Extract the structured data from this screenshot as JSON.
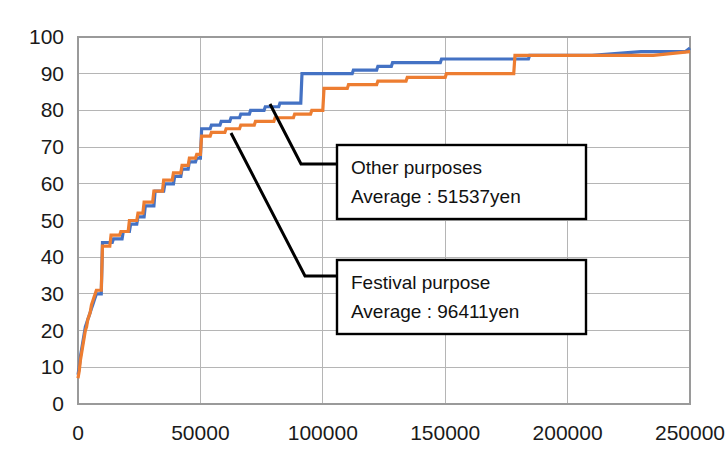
{
  "chart_data": {
    "type": "line",
    "title": "",
    "xlabel": "",
    "ylabel": "",
    "xlim": [
      0,
      250000
    ],
    "ylim": [
      0,
      100
    ],
    "grid": true,
    "legend_position": "annotation-boxes",
    "x_ticks": [
      0,
      50000,
      100000,
      150000,
      200000,
      250000
    ],
    "x_tick_labels": [
      "0",
      "50000",
      "100000",
      "150000",
      "200000",
      "250000"
    ],
    "y_ticks": [
      0,
      10,
      20,
      30,
      40,
      50,
      60,
      70,
      80,
      90,
      100
    ],
    "y_tick_labels": [
      "0",
      "10",
      "20",
      "30",
      "40",
      "50",
      "60",
      "70",
      "80",
      "90",
      "100"
    ],
    "series": [
      {
        "name": "Other purposes",
        "color": "#4472C4",
        "average_yen": 51537,
        "points": [
          [
            0,
            8
          ],
          [
            500,
            10
          ],
          [
            1000,
            13
          ],
          [
            1500,
            15
          ],
          [
            2000,
            17
          ],
          [
            2500,
            19
          ],
          [
            3000,
            21
          ],
          [
            3500,
            22
          ],
          [
            4000,
            23
          ],
          [
            4500,
            24
          ],
          [
            5000,
            25
          ],
          [
            5500,
            26
          ],
          [
            6000,
            27
          ],
          [
            6500,
            28
          ],
          [
            7000,
            29
          ],
          [
            7500,
            30
          ],
          [
            9500,
            30
          ],
          [
            10000,
            44
          ],
          [
            14000,
            44
          ],
          [
            14500,
            45
          ],
          [
            18000,
            45
          ],
          [
            18500,
            47
          ],
          [
            21000,
            47
          ],
          [
            21500,
            49
          ],
          [
            24000,
            49
          ],
          [
            24500,
            51
          ],
          [
            27000,
            51
          ],
          [
            27500,
            54
          ],
          [
            31000,
            54
          ],
          [
            31500,
            58
          ],
          [
            35000,
            58
          ],
          [
            35500,
            60
          ],
          [
            39000,
            60
          ],
          [
            39500,
            62
          ],
          [
            42000,
            62
          ],
          [
            42500,
            64
          ],
          [
            45000,
            64
          ],
          [
            45500,
            66
          ],
          [
            48000,
            66
          ],
          [
            48500,
            67
          ],
          [
            50000,
            67
          ],
          [
            50500,
            75
          ],
          [
            54000,
            75
          ],
          [
            54500,
            76
          ],
          [
            58000,
            76
          ],
          [
            58500,
            77
          ],
          [
            62000,
            77
          ],
          [
            62500,
            78
          ],
          [
            66000,
            78
          ],
          [
            66500,
            79
          ],
          [
            70000,
            79
          ],
          [
            70500,
            80
          ],
          [
            76000,
            80
          ],
          [
            76500,
            81
          ],
          [
            82000,
            81
          ],
          [
            82500,
            82
          ],
          [
            91000,
            82
          ],
          [
            91500,
            90
          ],
          [
            100000,
            90
          ],
          [
            100500,
            90
          ],
          [
            112000,
            90
          ],
          [
            112500,
            91
          ],
          [
            122000,
            91
          ],
          [
            122500,
            92
          ],
          [
            128000,
            92
          ],
          [
            128500,
            93
          ],
          [
            148000,
            93
          ],
          [
            148500,
            94
          ],
          [
            165000,
            94
          ],
          [
            165500,
            94
          ],
          [
            184000,
            94
          ],
          [
            184500,
            95
          ],
          [
            210000,
            95
          ],
          [
            230000,
            96
          ],
          [
            248000,
            96
          ],
          [
            250000,
            97
          ]
        ]
      },
      {
        "name": "Festival purpose",
        "color": "#ED7D31",
        "average_yen": 96411,
        "points": [
          [
            0,
            7
          ],
          [
            500,
            9
          ],
          [
            1000,
            12
          ],
          [
            1500,
            14
          ],
          [
            2000,
            16
          ],
          [
            2500,
            18
          ],
          [
            3000,
            20
          ],
          [
            3500,
            21
          ],
          [
            4000,
            23
          ],
          [
            4500,
            24
          ],
          [
            5000,
            25
          ],
          [
            5500,
            27
          ],
          [
            6000,
            28
          ],
          [
            6500,
            29
          ],
          [
            7000,
            30
          ],
          [
            7500,
            31
          ],
          [
            9500,
            31
          ],
          [
            10000,
            43
          ],
          [
            13000,
            43
          ],
          [
            13500,
            46
          ],
          [
            17000,
            46
          ],
          [
            17500,
            47
          ],
          [
            20500,
            47
          ],
          [
            21000,
            50
          ],
          [
            24000,
            50
          ],
          [
            24500,
            52
          ],
          [
            26500,
            52
          ],
          [
            27000,
            55
          ],
          [
            30500,
            55
          ],
          [
            31000,
            58
          ],
          [
            34500,
            58
          ],
          [
            35000,
            61
          ],
          [
            38500,
            61
          ],
          [
            39000,
            63
          ],
          [
            42000,
            63
          ],
          [
            42500,
            65
          ],
          [
            45000,
            65
          ],
          [
            45500,
            67
          ],
          [
            48000,
            67
          ],
          [
            48500,
            68
          ],
          [
            50000,
            68
          ],
          [
            50500,
            73
          ],
          [
            54000,
            73
          ],
          [
            54500,
            74
          ],
          [
            60000,
            74
          ],
          [
            60500,
            75
          ],
          [
            66000,
            75
          ],
          [
            66500,
            76
          ],
          [
            72000,
            76
          ],
          [
            72500,
            77
          ],
          [
            80000,
            77
          ],
          [
            80500,
            78
          ],
          [
            88000,
            78
          ],
          [
            88500,
            79
          ],
          [
            95000,
            79
          ],
          [
            95500,
            80
          ],
          [
            100000,
            80
          ],
          [
            100500,
            86
          ],
          [
            110000,
            86
          ],
          [
            110500,
            87
          ],
          [
            122000,
            87
          ],
          [
            122500,
            88
          ],
          [
            134000,
            88
          ],
          [
            134500,
            89
          ],
          [
            150000,
            89
          ],
          [
            150500,
            90
          ],
          [
            165000,
            90
          ],
          [
            178000,
            90
          ],
          [
            178500,
            95
          ],
          [
            195000,
            95
          ],
          [
            215000,
            95
          ],
          [
            235000,
            95
          ],
          [
            250000,
            96
          ]
        ]
      }
    ],
    "annotations": [
      {
        "id": "other-purposes",
        "line1": "Other purposes",
        "line2": "Average : 51537yen",
        "series": "Other purposes",
        "box": {
          "x": 337,
          "y": 145,
          "width": 249,
          "height": 74
        },
        "leader": "M 270 104 L 301 164 L 337 164"
      },
      {
        "id": "festival-purpose",
        "line1": "Festival purpose",
        "line2": "Average : 96411yen",
        "series": "Festival purpose",
        "box": {
          "x": 337,
          "y": 260,
          "width": 249,
          "height": 74
        },
        "leader": "M 231 133 L 305 276 L 337 276"
      }
    ]
  },
  "colors": {
    "series_blue": "#4472C4",
    "series_orange": "#ED7D31",
    "grid": "#b5b5b5",
    "border": "#9a9a9a",
    "text": "#1a1a1a",
    "background": "#ffffff"
  }
}
